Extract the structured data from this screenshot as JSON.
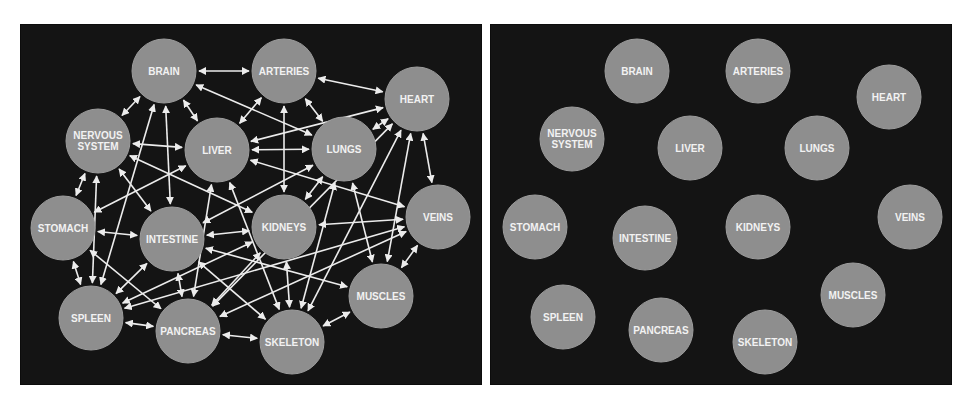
{
  "colors": {
    "background": "#ffffff",
    "panel": "#141414",
    "node_fill": "#8e8e8e",
    "label": "#f2f2f2",
    "edge": "#ececec"
  },
  "node_radius": 32,
  "panels": [
    {
      "id": "connected",
      "offset": [
        20,
        24
      ],
      "nodes": [
        {
          "id": "brain",
          "label": [
            "BRAIN"
          ],
          "x": 144,
          "y": 47
        },
        {
          "id": "arteries",
          "label": [
            "ARTERIES"
          ],
          "x": 264,
          "y": 47
        },
        {
          "id": "heart",
          "label": [
            "HEART"
          ],
          "x": 397,
          "y": 75
        },
        {
          "id": "nervous",
          "label": [
            "NERVOUS",
            "SYSTEM"
          ],
          "x": 78,
          "y": 117
        },
        {
          "id": "liver",
          "label": [
            "LIVER"
          ],
          "x": 197,
          "y": 126
        },
        {
          "id": "lungs",
          "label": [
            "LUNGS"
          ],
          "x": 324,
          "y": 125
        },
        {
          "id": "stomach",
          "label": [
            "STOMACH"
          ],
          "x": 43,
          "y": 204
        },
        {
          "id": "intestine",
          "label": [
            "INTESTINE"
          ],
          "x": 152,
          "y": 215
        },
        {
          "id": "kidneys",
          "label": [
            "KIDNEYS"
          ],
          "x": 264,
          "y": 203
        },
        {
          "id": "veins",
          "label": [
            "VEINS"
          ],
          "x": 418,
          "y": 193
        },
        {
          "id": "muscles",
          "label": [
            "MUSCLES"
          ],
          "x": 361,
          "y": 272
        },
        {
          "id": "spleen",
          "label": [
            "SPLEEN"
          ],
          "x": 71,
          "y": 294
        },
        {
          "id": "pancreas",
          "label": [
            "PANCREAS"
          ],
          "x": 168,
          "y": 307
        },
        {
          "id": "skeleton",
          "label": [
            "SKELETON"
          ],
          "x": 272,
          "y": 318
        }
      ],
      "edges": [
        [
          "brain",
          "arteries"
        ],
        [
          "arteries",
          "heart"
        ],
        [
          "brain",
          "nervous"
        ],
        [
          "brain",
          "liver"
        ],
        [
          "brain",
          "lungs"
        ],
        [
          "brain",
          "intestine"
        ],
        [
          "brain",
          "spleen"
        ],
        [
          "arteries",
          "liver"
        ],
        [
          "arteries",
          "lungs"
        ],
        [
          "arteries",
          "kidneys"
        ],
        [
          "heart",
          "lungs"
        ],
        [
          "heart",
          "liver"
        ],
        [
          "heart",
          "veins"
        ],
        [
          "heart",
          "skeleton"
        ],
        [
          "heart",
          "muscles"
        ],
        [
          "heart",
          "pancreas"
        ],
        [
          "nervous",
          "liver"
        ],
        [
          "nervous",
          "stomach"
        ],
        [
          "nervous",
          "spleen"
        ],
        [
          "nervous",
          "kidneys"
        ],
        [
          "nervous",
          "intestine"
        ],
        [
          "liver",
          "lungs"
        ],
        [
          "liver",
          "stomach"
        ],
        [
          "liver",
          "pancreas"
        ],
        [
          "liver",
          "skeleton"
        ],
        [
          "liver",
          "veins"
        ],
        [
          "lungs",
          "kidneys"
        ],
        [
          "lungs",
          "intestine"
        ],
        [
          "lungs",
          "muscles"
        ],
        [
          "lungs",
          "skeleton"
        ],
        [
          "stomach",
          "intestine"
        ],
        [
          "stomach",
          "spleen"
        ],
        [
          "stomach",
          "pancreas"
        ],
        [
          "intestine",
          "spleen"
        ],
        [
          "intestine",
          "pancreas"
        ],
        [
          "intestine",
          "kidneys"
        ],
        [
          "intestine",
          "muscles"
        ],
        [
          "intestine",
          "skeleton"
        ],
        [
          "kidneys",
          "veins"
        ],
        [
          "kidneys",
          "skeleton"
        ],
        [
          "kidneys",
          "spleen"
        ],
        [
          "veins",
          "muscles"
        ],
        [
          "veins",
          "spleen"
        ],
        [
          "veins",
          "pancreas"
        ],
        [
          "muscles",
          "skeleton"
        ],
        [
          "spleen",
          "pancreas"
        ],
        [
          "pancreas",
          "skeleton"
        ],
        [
          "kidneys",
          "pancreas"
        ]
      ]
    },
    {
      "id": "disconnected",
      "offset": [
        490,
        24
      ],
      "nodes": [
        {
          "id": "brain",
          "label": [
            "BRAIN"
          ],
          "x": 147,
          "y": 47
        },
        {
          "id": "arteries",
          "label": [
            "ARTERIES"
          ],
          "x": 268,
          "y": 47
        },
        {
          "id": "heart",
          "label": [
            "HEART"
          ],
          "x": 399,
          "y": 73
        },
        {
          "id": "nervous",
          "label": [
            "NERVOUS",
            "SYSTEM"
          ],
          "x": 82,
          "y": 115
        },
        {
          "id": "liver",
          "label": [
            "LIVER"
          ],
          "x": 200,
          "y": 124
        },
        {
          "id": "lungs",
          "label": [
            "LUNGS"
          ],
          "x": 327,
          "y": 124
        },
        {
          "id": "stomach",
          "label": [
            "STOMACH"
          ],
          "x": 45,
          "y": 203
        },
        {
          "id": "intestine",
          "label": [
            "INTESTINE"
          ],
          "x": 155,
          "y": 214
        },
        {
          "id": "kidneys",
          "label": [
            "KIDNEYS"
          ],
          "x": 268,
          "y": 203
        },
        {
          "id": "veins",
          "label": [
            "VEINS"
          ],
          "x": 420,
          "y": 193
        },
        {
          "id": "muscles",
          "label": [
            "MUSCLES"
          ],
          "x": 363,
          "y": 271
        },
        {
          "id": "spleen",
          "label": [
            "SPLEEN"
          ],
          "x": 73,
          "y": 293
        },
        {
          "id": "pancreas",
          "label": [
            "PANCREAS"
          ],
          "x": 171,
          "y": 306
        },
        {
          "id": "skeleton",
          "label": [
            "SKELETON"
          ],
          "x": 275,
          "y": 318
        }
      ],
      "edges": []
    }
  ]
}
